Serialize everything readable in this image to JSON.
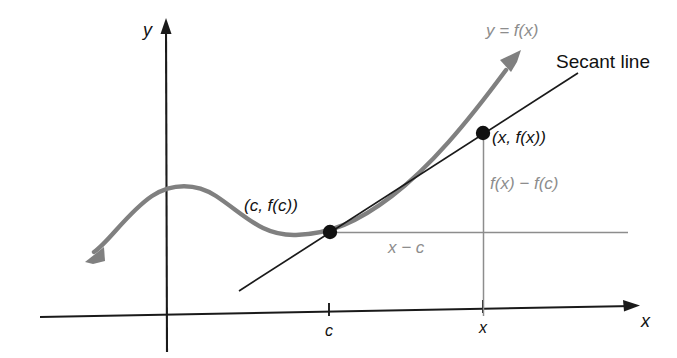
{
  "figure": {
    "axes": {
      "x_axis_label": "x",
      "y_axis_label": "y",
      "x_ticks": [
        {
          "label": "c",
          "position": 329
        },
        {
          "label": "x",
          "position": 483
        }
      ]
    },
    "labels": {
      "curve_name": "y = f(x)",
      "secant_line": "Secant line",
      "point_c": "(c, f(c))",
      "point_x": "(x, f(x))",
      "rise": "f(x) − f(c)",
      "run": "x − c"
    },
    "colors": {
      "curve": "#808080",
      "secant": "#1a1a1a",
      "axis": "#1a1a1a",
      "helper": "#8d8d8d",
      "point": "#111111",
      "background": "#ffffff"
    },
    "points": [
      {
        "name": "point-c",
        "label": "(c, f(c))",
        "x": 329,
        "y": 232
      },
      {
        "name": "point-x",
        "label": "(x, f(x))",
        "x": 483,
        "y": 133
      }
    ]
  }
}
